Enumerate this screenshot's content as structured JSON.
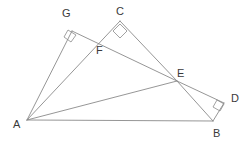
{
  "figure": {
    "type": "geometry-diagram",
    "width": 249,
    "height": 145,
    "background_color": "#ffffff",
    "line_color": "#8a8a8a",
    "label_color": "#3a3a3a",
    "line_width": 0.9,
    "points": {
      "A": {
        "label": "A",
        "x": 27,
        "y": 120,
        "label_x": 13,
        "label_y": 119
      },
      "B": {
        "label": "B",
        "x": 213,
        "y": 121,
        "label_x": 213,
        "label_y": 128
      },
      "C": {
        "label": "C",
        "x": 120,
        "y": 21,
        "label_x": 116,
        "label_y": 6
      },
      "D": {
        "label": "D",
        "x": 224,
        "y": 103,
        "label_x": 231,
        "label_y": 93
      },
      "E": {
        "label": "E",
        "x": 177,
        "y": 81,
        "label_x": 177,
        "label_y": 68
      },
      "F": {
        "label": "F",
        "x": 100,
        "y": 42,
        "label_x": 96,
        "label_y": 45
      },
      "G": {
        "label": "G",
        "x": 72,
        "y": 31,
        "label_x": 62,
        "label_y": 8
      }
    },
    "segments": [
      {
        "name": "segment-AB",
        "from": "A",
        "to": "B"
      },
      {
        "name": "segment-AC",
        "from": "A",
        "to": "C"
      },
      {
        "name": "segment-AE",
        "from": "A",
        "to": "E"
      },
      {
        "name": "segment-AG",
        "from": "A",
        "to": "G"
      },
      {
        "name": "segment-GE",
        "from": "G",
        "to": "E"
      },
      {
        "name": "segment-CE",
        "from": "C",
        "to": "E"
      },
      {
        "name": "segment-EB",
        "from": "E",
        "to": "B"
      },
      {
        "name": "segment-ED",
        "from": "E",
        "to": "D"
      },
      {
        "name": "segment-DB",
        "from": "D",
        "to": "B"
      }
    ],
    "right_angles": [
      {
        "name": "right-angle-at-G",
        "vertex": "G",
        "size": 8
      },
      {
        "name": "right-angle-at-C",
        "vertex": "C",
        "size": 8
      },
      {
        "name": "right-angle-at-D",
        "vertex": "D",
        "size": 8
      }
    ],
    "right_angle_marks": [
      {
        "name": "right-angle-mark-G",
        "points": "68,30 76,35 71,42 64,37"
      },
      {
        "name": "right-angle-mark-C",
        "points": "120,24 127,31 120,38 113,31"
      },
      {
        "name": "right-angle-mark-D",
        "points": "217,100 224,104 220,111 213,107"
      }
    ]
  }
}
